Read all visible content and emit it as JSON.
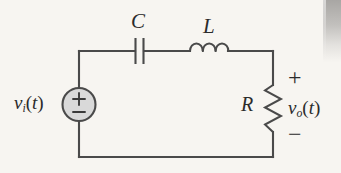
{
  "figure": {
    "kind": "circuit-schematic",
    "background_color": "#f7f5f1",
    "wire_color": "#4a4a4a",
    "ink_color": "#2b2b2b",
    "source_fill_color": "#d9d9d9"
  },
  "components": {
    "capacitor": {
      "label": "C",
      "symbol": "capacitor-icon",
      "position": "top-branch-left"
    },
    "inductor": {
      "label": "L",
      "symbol": "inductor-icon",
      "coils": 3,
      "position": "top-branch-right"
    },
    "resistor": {
      "label": "R",
      "symbol": "resistor-icon",
      "position": "right-branch"
    },
    "source": {
      "label": "v",
      "label_sub": "i",
      "label_arg": "(t)",
      "full_label": "vi(t)",
      "symbol": "voltage-source-icon",
      "plus": "+",
      "minus": "−",
      "position": "left-branch"
    }
  },
  "output": {
    "label": "v",
    "label_sub": "o",
    "label_arg": "(t)",
    "full_label": "vo(t)",
    "plus": "+",
    "minus": "−"
  }
}
